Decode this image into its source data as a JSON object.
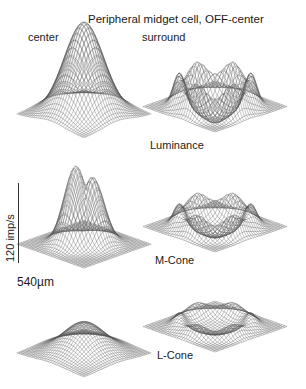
{
  "figure": {
    "title": "Peripheral midget cell, OFF-center",
    "column_labels": {
      "center": "center",
      "surround": "surround"
    },
    "row_labels": [
      "Luminance",
      "M-Cone",
      "L-Cone"
    ],
    "scale_bars": {
      "vertical": "120 imp/s",
      "horizontal": "540µm"
    },
    "colors": {
      "mesh": "#555555",
      "text": "#1a1a1a",
      "background": "#ffffff"
    }
  },
  "panels": [
    {
      "id": "luminance-center",
      "row": "Luminance",
      "column": "center",
      "shape": "peak",
      "amplitude": 1.0,
      "width": 0.42,
      "bumps": 1
    },
    {
      "id": "luminance-surround",
      "row": "Luminance",
      "column": "surround",
      "shape": "bowl",
      "amplitude": 0.75,
      "width": 0.55
    },
    {
      "id": "mcone-center",
      "row": "M-Cone",
      "column": "center",
      "shape": "double-peak",
      "amplitude": 0.85,
      "width": 0.25
    },
    {
      "id": "mcone-surround",
      "row": "M-Cone",
      "column": "surround",
      "shape": "bowl",
      "amplitude": 0.55,
      "width": 0.55
    },
    {
      "id": "lcone-center",
      "row": "L-Cone",
      "column": "center",
      "shape": "peak",
      "amplitude": 0.45,
      "width": 0.45,
      "bumps": 1
    },
    {
      "id": "lcone-surround",
      "row": "L-Cone",
      "column": "surround",
      "shape": "bowl",
      "amplitude": 0.35,
      "width": 0.55
    }
  ]
}
